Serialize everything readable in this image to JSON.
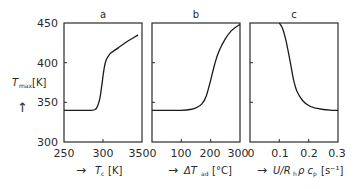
{
  "chart_data": [
    {
      "type": "line",
      "panel": "a",
      "title": "a",
      "xlabel": "T_c [K]",
      "ylabel": "T_max [K]",
      "xlim": [
        250,
        350
      ],
      "ylim": [
        300,
        450
      ],
      "xticks": [
        250,
        300,
        350
      ],
      "yticks": [
        300,
        350,
        400,
        450
      ],
      "x": [
        250,
        270,
        285,
        290,
        293,
        296,
        298,
        300,
        302,
        304,
        306,
        310,
        320,
        330,
        340,
        345
      ],
      "y": [
        340,
        340,
        340,
        341,
        345,
        355,
        368,
        383,
        396,
        403,
        407,
        412,
        419,
        426,
        432,
        435
      ]
    },
    {
      "type": "line",
      "panel": "b",
      "title": "b",
      "xlabel": "ΔT_ad [°C]",
      "ylabel": "T_max [K]",
      "xlim": [
        0,
        300
      ],
      "ylim": [
        300,
        450
      ],
      "xticks": [
        0,
        100,
        200,
        300
      ],
      "yticks": [
        300,
        350,
        400,
        450
      ],
      "x": [
        0,
        50,
        100,
        130,
        150,
        170,
        185,
        200,
        215,
        230,
        250,
        270,
        290,
        300
      ],
      "y": [
        340,
        340,
        340,
        341,
        343,
        348,
        358,
        378,
        400,
        416,
        430,
        440,
        446,
        448
      ]
    },
    {
      "type": "line",
      "panel": "c",
      "title": "c",
      "xlabel": "U/R_h ρ c_p [s⁻¹]",
      "ylabel": "T_max [K]",
      "xlim": [
        0,
        0.3
      ],
      "ylim": [
        300,
        450
      ],
      "xticks": [
        0,
        0.1,
        0.2,
        0.3
      ],
      "yticks": [
        300,
        350,
        400,
        450
      ],
      "x": [
        0.1,
        0.11,
        0.12,
        0.13,
        0.14,
        0.15,
        0.16,
        0.18,
        0.2,
        0.22,
        0.25,
        0.28,
        0.3
      ],
      "y": [
        450,
        444,
        432,
        415,
        395,
        376,
        364,
        352,
        346,
        343,
        341,
        340,
        340
      ]
    }
  ],
  "labels": {
    "ylabel_main": "T",
    "ylabel_sub": "max",
    "ylabel_unit": "[K]",
    "ylabel_arrow": "↑",
    "panel_a": "a",
    "panel_b": "b",
    "panel_c": "c",
    "xlabel_a_main": "T",
    "xlabel_a_sub": "c",
    "xlabel_a_unit": "[K]",
    "xlabel_b_main": "ΔT",
    "xlabel_b_sub": "ad",
    "xlabel_b_unit": "[°C]",
    "xlabel_c_main": "U/R",
    "xlabel_c_sub": "h",
    "xlabel_c_mid": "ρ c",
    "xlabel_c_sub2": "p",
    "xlabel_c_unit": "[s⁻¹]",
    "arrow": "→",
    "yticks": [
      "450",
      "400",
      "350",
      "300"
    ],
    "xticks_a": [
      "250",
      "300",
      "350"
    ],
    "xticks_b": [
      "0",
      "100",
      "200",
      "300"
    ],
    "xticks_c": [
      "0",
      "0.1",
      "0.2",
      "0.3"
    ]
  }
}
